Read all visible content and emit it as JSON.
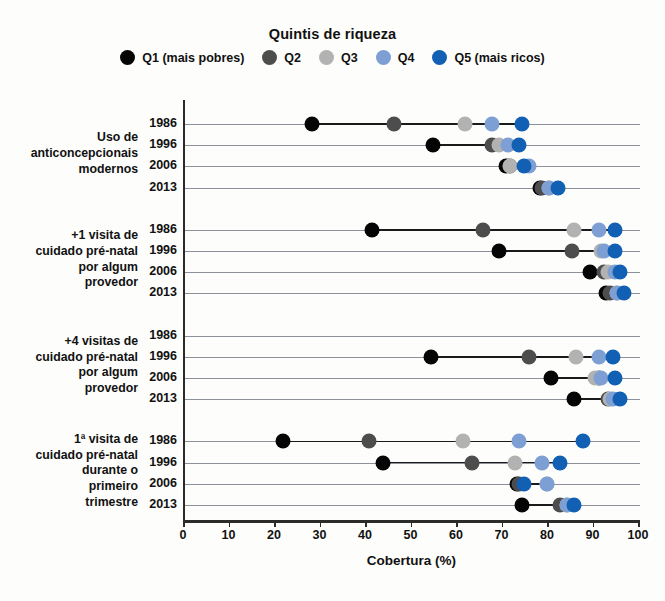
{
  "legend": {
    "title": "Quintis de riqueza",
    "items": [
      {
        "key": "Q1",
        "label": "Q1 (mais pobres)",
        "color": "#050505"
      },
      {
        "key": "Q2",
        "label": "Q2",
        "color": "#4d4d4d"
      },
      {
        "key": "Q3",
        "label": "Q3",
        "color": "#b2b2b2"
      },
      {
        "key": "Q4",
        "label": "Q4",
        "color": "#7d9fd4"
      },
      {
        "key": "Q5",
        "label": "Q5 (mais ricos)",
        "color": "#1160b4"
      }
    ]
  },
  "axis": {
    "x_title": "Cobertura (%)",
    "x_ticks": [
      0,
      10,
      20,
      30,
      40,
      50,
      60,
      70,
      80,
      90,
      100
    ],
    "x_min": 0,
    "x_max": 100
  },
  "chart_data": {
    "type": "scatter",
    "title": "",
    "xlabel": "Cobertura (%)",
    "ylabel": "",
    "xlim": [
      0,
      100
    ],
    "grid": true,
    "legend_position": "top",
    "legend_title": "Quintis de riqueza",
    "series": [
      {
        "name": "Q1 (mais pobres)",
        "color": "#050505"
      },
      {
        "name": "Q2",
        "color": "#4d4d4d"
      },
      {
        "name": "Q3",
        "color": "#b2b2b2"
      },
      {
        "name": "Q4",
        "color": "#7d9fd4"
      },
      {
        "name": "Q5 (mais ricos)",
        "color": "#1160b4"
      }
    ],
    "groups": [
      {
        "label": "Uso de anticoncepcionais modernos",
        "label_lines": [
          "Uso de",
          "anticoncepcionais",
          "modernos"
        ],
        "rows": [
          {
            "year": "1986",
            "Q1": 28,
            "Q2": 46,
            "Q3": 61.5,
            "Q4": 67.5,
            "Q5": 74
          },
          {
            "year": "1996",
            "Q1": 54.5,
            "Q2": 67.5,
            "Q3": 69,
            "Q4": 71,
            "Q5": 73.5
          },
          {
            "year": "2006",
            "Q1": 70.5,
            "Q2": 71.5,
            "Q3": 71.5,
            "Q4": 75.5,
            "Q5": 74.5
          },
          {
            "year": "2013",
            "Q1": 78,
            "Q2": 78.5,
            "Q3": 80,
            "Q4": 80,
            "Q5": 82
          }
        ]
      },
      {
        "label": "+1 visita de cuidado pré-natal por algum provedor",
        "label_lines": [
          "+1 visita de",
          "cuidado pré-natal",
          "por algum",
          "provedor"
        ],
        "rows": [
          {
            "year": "1986",
            "Q1": 41,
            "Q2": 65.5,
            "Q3": 85.5,
            "Q4": 91,
            "Q5": 94.5
          },
          {
            "year": "1996",
            "Q1": 69,
            "Q2": 85,
            "Q3": 91.5,
            "Q4": 92,
            "Q5": 94.5
          },
          {
            "year": "2006",
            "Q1": 89,
            "Q2": 92,
            "Q3": 93,
            "Q4": 94.5,
            "Q5": 95.5
          },
          {
            "year": "2013",
            "Q1": 92.5,
            "Q2": 93.5,
            "Q3": 95,
            "Q4": 95,
            "Q5": 96.5
          }
        ]
      },
      {
        "label": "+4 visitas de cuidado pré-natal por algum provedor",
        "label_lines": [
          "+4 visitas de",
          "cuidado pré-natal",
          "por algum",
          "provedor"
        ],
        "rows": [
          {
            "year": "1986"
          },
          {
            "year": "1996",
            "Q1": 54,
            "Q2": 75.5,
            "Q3": 86,
            "Q4": 91,
            "Q5": 94
          },
          {
            "year": "2006",
            "Q1": 80.5,
            "Q2": 91,
            "Q3": 90,
            "Q4": 91.5,
            "Q5": 94.5
          },
          {
            "year": "2013",
            "Q1": 85.5,
            "Q2": 93,
            "Q3": 93.5,
            "Q4": 94,
            "Q5": 95.5
          }
        ]
      },
      {
        "label": "1ª visita de cuidado pré-natal durante o primeiro trimestre",
        "label_lines": [
          "1ª visita de",
          "cuidado pré-natal",
          "durante o",
          "primeiro",
          "trimestre"
        ],
        "rows": [
          {
            "year": "1986",
            "Q1": 21.5,
            "Q2": 40.5,
            "Q3": 61,
            "Q4": 73.5,
            "Q5": 87.5
          },
          {
            "year": "1996",
            "Q1": 43.5,
            "Q2": 63,
            "Q3": 72.5,
            "Q4": 78.5,
            "Q5": 82.5
          },
          {
            "year": "2006",
            "Q1": 73,
            "Q2": 73.5,
            "Q3": 79.5,
            "Q4": 79.5,
            "Q5": 74.5
          },
          {
            "year": "2013",
            "Q1": 74,
            "Q2": 82.5,
            "Q3": 84,
            "Q4": 84,
            "Q5": 85.5
          }
        ]
      }
    ]
  }
}
